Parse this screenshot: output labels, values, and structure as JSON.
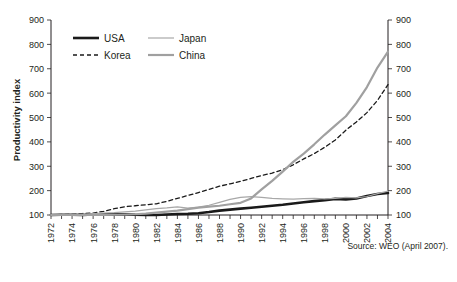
{
  "chart_data": {
    "type": "line",
    "title": "",
    "xlabel": "",
    "ylabel": "Productivity index",
    "source": "Source: WEO (April 2007).",
    "xlim": [
      1972,
      2004
    ],
    "ylim": [
      100,
      900
    ],
    "yticks": [
      100,
      200,
      300,
      400,
      500,
      600,
      700,
      800,
      900
    ],
    "ytick_labels": [
      "100",
      "200",
      "300",
      "400",
      "500",
      "600",
      "700",
      "800",
      "900"
    ],
    "right_axis_labels": [
      "100",
      "200",
      "300",
      "400",
      "500",
      "600",
      "700",
      "800",
      "900"
    ],
    "grid": false,
    "legend_position": "top-left-inside",
    "x": [
      1972,
      1973,
      1974,
      1975,
      1976,
      1977,
      1978,
      1979,
      1980,
      1981,
      1982,
      1983,
      1984,
      1985,
      1986,
      1987,
      1988,
      1989,
      1990,
      1991,
      1992,
      1993,
      1994,
      1995,
      1996,
      1997,
      1998,
      1999,
      2000,
      2001,
      2002,
      2003,
      2004
    ],
    "xtick_labels": [
      "1972",
      "1974",
      "1976",
      "1978",
      "1980",
      "1982",
      "1984",
      "1986",
      "1988",
      "1990",
      "1992",
      "1994",
      "1996",
      "1998",
      "2000",
      "2002",
      "2004"
    ],
    "xticks": [
      1972,
      1974,
      1976,
      1978,
      1980,
      1982,
      1984,
      1986,
      1988,
      1990,
      1992,
      1994,
      1996,
      1998,
      2000,
      2002,
      2004
    ],
    "series": [
      {
        "name": "USA",
        "color": "#1a1a1a",
        "width": 2.6,
        "dash": "none",
        "values": [
          100,
          101,
          101,
          100,
          102,
          103,
          103,
          103,
          101,
          100,
          100,
          102,
          104,
          105,
          107,
          112,
          118,
          122,
          126,
          130,
          134,
          138,
          142,
          147,
          152,
          157,
          161,
          166,
          164,
          168,
          178,
          186,
          190
        ]
      },
      {
        "name": "Korea",
        "color": "#1a1a1a",
        "width": 1.3,
        "dash": "4,3",
        "values": [
          100,
          102,
          104,
          106,
          108,
          115,
          126,
          134,
          138,
          142,
          146,
          156,
          168,
          180,
          192,
          205,
          218,
          228,
          238,
          250,
          262,
          272,
          286,
          306,
          330,
          352,
          378,
          408,
          448,
          482,
          520,
          570,
          635
        ]
      },
      {
        "name": "Japan",
        "color": "#a8a8a8",
        "width": 1.2,
        "dash": "none",
        "values": [
          100,
          103,
          104,
          103,
          106,
          108,
          110,
          113,
          116,
          121,
          126,
          129,
          133,
          128,
          132,
          140,
          152,
          164,
          172,
          175,
          172,
          168,
          166,
          165,
          167,
          168,
          166,
          168,
          172,
          170,
          176,
          188,
          198
        ]
      },
      {
        "name": "China",
        "color": "#a0a0a0",
        "width": 2.2,
        "dash": "none",
        "values": [
          100,
          101,
          100,
          101,
          100,
          100,
          101,
          102,
          103,
          106,
          110,
          114,
          118,
          124,
          130,
          134,
          138,
          144,
          150,
          168,
          205,
          240,
          278,
          318,
          352,
          390,
          430,
          468,
          505,
          560,
          625,
          705,
          770
        ]
      }
    ]
  },
  "legend": {
    "items": [
      {
        "label": "USA"
      },
      {
        "label": "Japan"
      },
      {
        "label": "Korea"
      },
      {
        "label": "China"
      }
    ]
  }
}
